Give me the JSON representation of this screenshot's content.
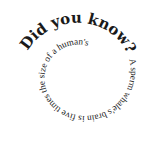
{
  "spiral": {
    "headline": "Did you know? ",
    "fact": "A sperm whale's brain is five times the size of a human's"
  },
  "colors": {
    "background": "#ffffff",
    "text": "#1a1a1a"
  }
}
